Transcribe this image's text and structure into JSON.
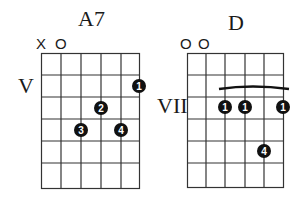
{
  "diagrams": [
    {
      "name": "A7",
      "string_markers": [
        "X",
        "O",
        "",
        "",
        "",
        ""
      ],
      "position_label": "V",
      "strings": 6,
      "frets_shown": 6,
      "fingers": [
        {
          "string": 6,
          "fret": 1,
          "finger": "1"
        },
        {
          "string": 5,
          "fret": 2,
          "finger": "2"
        },
        {
          "string": 3,
          "fret": 3,
          "finger": "3"
        },
        {
          "string": 5,
          "fret": 3,
          "finger": "4"
        }
      ]
    },
    {
      "name": "D",
      "string_markers": [
        "O",
        "O",
        "",
        "",
        "",
        ""
      ],
      "position_label": "VII",
      "strings": 6,
      "frets_shown": 6,
      "barre": {
        "from_string": 3,
        "to_string": 6,
        "fret": 2
      },
      "fingers": [
        {
          "string": 3,
          "fret": 2,
          "finger": "1"
        },
        {
          "string": 4,
          "fret": 2,
          "finger": "1"
        },
        {
          "string": 6,
          "fret": 2,
          "finger": "1"
        },
        {
          "string": 5,
          "fret": 4,
          "finger": "4"
        }
      ]
    }
  ],
  "colors": {
    "ink": "#1a1a1a",
    "grid": "#333333",
    "background": "#ffffff"
  }
}
